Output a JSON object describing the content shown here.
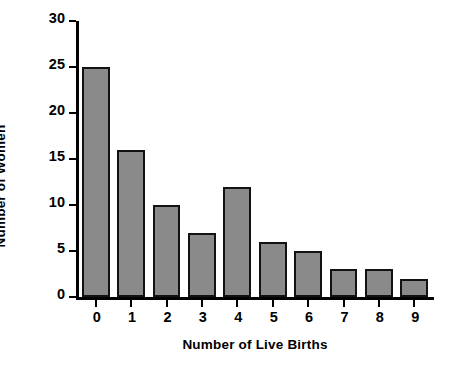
{
  "chart_data": {
    "type": "bar",
    "title": "",
    "xlabel": "Number of Live Births",
    "ylabel": "Number of Women",
    "categories": [
      "0",
      "1",
      "2",
      "3",
      "4",
      "5",
      "6",
      "7",
      "8",
      "9"
    ],
    "values": [
      25,
      16,
      10,
      7,
      12,
      6,
      5,
      3,
      3,
      2
    ],
    "ylim": [
      0,
      30
    ],
    "yticks": [
      0,
      5,
      10,
      15,
      20,
      25,
      30
    ],
    "ytick_labels": [
      "0",
      "5",
      "10",
      "15",
      "20",
      "25",
      "30"
    ],
    "grid": false,
    "legend": null,
    "bar_color": "#8a8a8a",
    "bar_edge_color": "#121212",
    "axis_color": "#000000",
    "background": "#ffffff"
  }
}
